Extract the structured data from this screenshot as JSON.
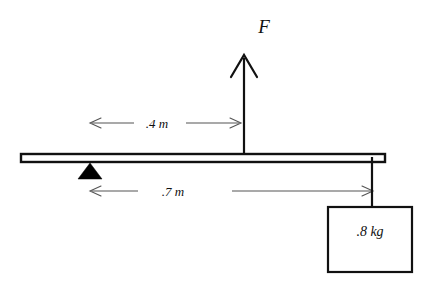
{
  "diagram": {
    "background_color": "#ffffff",
    "stroke_color": "#111111",
    "fill_color": "#000000",
    "force": {
      "label": "F",
      "direction": "up",
      "arrow_x": 244,
      "arrow_tip_y": 55,
      "arrow_base_y": 156,
      "label_x": 264,
      "label_y": 33
    },
    "beam": {
      "name": "rigid-beam",
      "left_x": 21,
      "right_x": 385,
      "top_y": 154,
      "bottom_y": 162,
      "fill": "#ffffff",
      "stroke": "#111111"
    },
    "fulcrum": {
      "name": "pivot-triangle",
      "apex_x": 90,
      "apex_y": 164,
      "base_left_x": 78,
      "base_right_x": 102,
      "base_y": 179,
      "fill": "#000000"
    },
    "dimensions": [
      {
        "name": "distance-fulcrum-to-force",
        "label": ".4 m",
        "value": 0.4,
        "unit": "m",
        "y": 123,
        "left_x": 90,
        "right_x": 240,
        "label_x": 157,
        "label_y": 128,
        "arrow_style": "double-open"
      },
      {
        "name": "distance-fulcrum-to-mass",
        "label": ".7 m",
        "value": 0.7,
        "unit": "m",
        "y": 191,
        "left_x": 90,
        "right_x": 372,
        "label_x": 173,
        "label_y": 196,
        "arrow_style": "double-open"
      }
    ],
    "hanging_mass": {
      "name": "hanging-block",
      "label": ".8 kg",
      "value": 0.8,
      "unit": "kg",
      "box_left_x": 328,
      "box_top_y": 207,
      "box_width": 84,
      "box_height": 65,
      "label_x": 370,
      "label_y": 236,
      "string_x": 372,
      "string_top_y": 158,
      "string_bottom_y": 207,
      "fill": "#ffffff",
      "stroke": "#111111"
    }
  }
}
